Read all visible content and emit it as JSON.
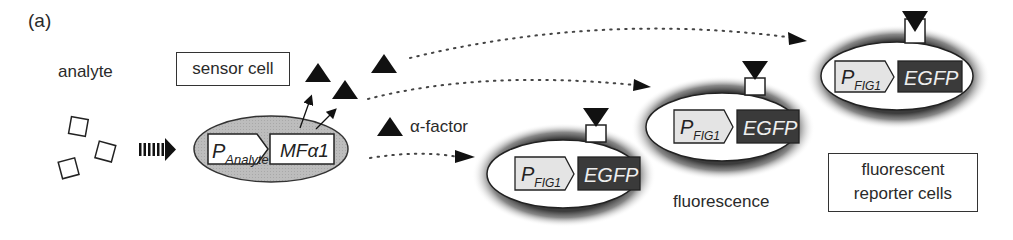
{
  "panel_label": "(a)",
  "labels": {
    "analyte": "analyte",
    "sensor_cell": "sensor cell",
    "alpha_factor": "α-factor",
    "fluorescence": "fluorescence",
    "reporter_cells_line1": "fluorescent",
    "reporter_cells_line2": "reporter cells"
  },
  "sensor_construct": {
    "promoter_main": "P",
    "promoter_sub": "Analyte",
    "gene": "MFα1"
  },
  "reporter_construct": {
    "promoter_main": "P",
    "promoter_sub": "FIG1",
    "gene": "EGFP"
  },
  "reporter_cells_count": 3,
  "colors": {
    "sensor_cell_fill": "#b8b8b8",
    "promoter_fill": "#e4e4e4",
    "egfp_fill": "#3a3a3a",
    "glow": "#555555",
    "stroke": "#222222"
  }
}
